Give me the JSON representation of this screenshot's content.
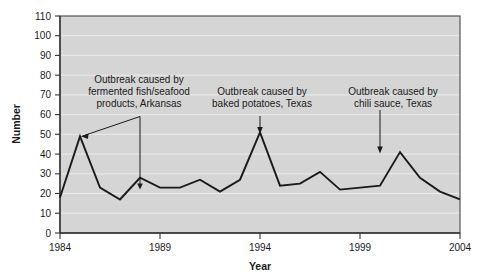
{
  "chart_data": {
    "type": "line",
    "title": "",
    "xlabel": "Year",
    "ylabel": "Number",
    "xlim": [
      1984,
      2004
    ],
    "ylim": [
      0,
      110
    ],
    "ytick_step": 10,
    "yticks": [
      "0",
      "10",
      "20",
      "30",
      "40",
      "50",
      "60",
      "70",
      "80",
      "90",
      "100",
      "110"
    ],
    "xticks": [
      "1984",
      "1989",
      "1994",
      "1999",
      "2004"
    ],
    "grid": true,
    "grid_axis": "y",
    "legend": "none",
    "plot_bgcolor": "#d5d5d5",
    "grid_color": "#e8e8e8",
    "line_color": "#1a1a1a",
    "x": [
      1984,
      1985,
      1986,
      1987,
      1988,
      1989,
      1990,
      1991,
      1992,
      1993,
      1994,
      1995,
      1996,
      1997,
      1998,
      1999,
      2000,
      2001,
      2002,
      2003,
      2004
    ],
    "values": [
      18,
      49,
      23,
      17,
      28,
      23,
      23,
      27,
      21,
      27,
      51,
      24,
      25,
      31,
      22,
      23,
      24,
      41,
      28,
      21,
      17
    ],
    "series": [
      {
        "name": "Number of outbreaks",
        "values": [
          18,
          49,
          23,
          17,
          28,
          23,
          23,
          27,
          21,
          27,
          51,
          24,
          25,
          31,
          22,
          23,
          24,
          41,
          28,
          21,
          17
        ]
      }
    ],
    "annotations": [
      {
        "id": "annotation-fermented-fish",
        "lines": [
          "Outbreak caused by",
          "fermented fish/seafood",
          "products, Arkansas"
        ],
        "points_to_years": [
          1985,
          1988
        ],
        "points_to_values": [
          49,
          28
        ]
      },
      {
        "id": "annotation-baked-potatoes",
        "lines": [
          "Outbreak caused by",
          "baked potatoes, Texas"
        ],
        "points_to_years": [
          1994
        ],
        "points_to_values": [
          51
        ]
      },
      {
        "id": "annotation-chili-sauce",
        "lines": [
          "Outbreak caused by",
          "chili sauce, Texas"
        ],
        "points_to_years": [
          2001
        ],
        "points_to_values": [
          41
        ]
      }
    ]
  },
  "axes": {
    "ylabel": "Number",
    "xlabel": "Year",
    "yticks": [
      "110",
      "100",
      "90",
      "80",
      "70",
      "60",
      "50",
      "40",
      "30",
      "20",
      "10",
      "0"
    ],
    "xticks": [
      "1984",
      "1989",
      "1994",
      "1999",
      "2004"
    ]
  },
  "annotations": {
    "a1_l1": "Outbreak caused by",
    "a1_l2": "fermented fish/seafood",
    "a1_l3": "products, Arkansas",
    "a2_l1": "Outbreak caused by",
    "a2_l2": "baked potatoes, Texas",
    "a3_l1": "Outbreak caused by",
    "a3_l2": "chili sauce, Texas"
  }
}
